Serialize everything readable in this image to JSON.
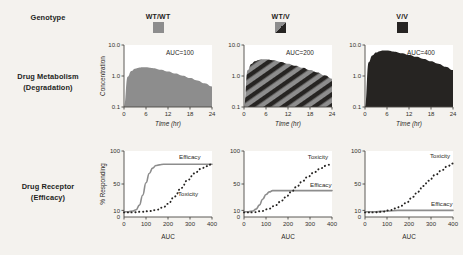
{
  "figure": {
    "background_color": "#f4f2ee",
    "row_labels": {
      "genotype": "Genotype",
      "metabolism_line1": "Drug Metabolism",
      "metabolism_line2": "(Degradation)",
      "receptor_line1": "Drug Receptor",
      "receptor_line2": "(Efficacy)"
    },
    "colors": {
      "light_gray": "#8d8d8d",
      "dark": "#262422",
      "axis": "#4a4744",
      "panel": "#ffffff"
    }
  },
  "genotypes": [
    {
      "label": "WT/WT",
      "swatch": "solid-gray-swatch-icon"
    },
    {
      "label": "WT/V",
      "swatch": "half-diagonal-swatch-icon"
    },
    {
      "label": "V/V",
      "swatch": "solid-dark-swatch-icon"
    }
  ],
  "chart_data": [
    {
      "type": "area",
      "panel": "metabolism-wt-wt",
      "genotype": "WT/WT",
      "title": "",
      "annotation": "AUC=100",
      "xlabel": "Time (hr)",
      "ylabel": "Concentration",
      "xlim": [
        0,
        24
      ],
      "ylim": [
        0.1,
        10.0
      ],
      "yscale": "log",
      "xticks": [
        0,
        6,
        12,
        18,
        24
      ],
      "xticklabels": [
        "0",
        "6",
        "12",
        "18",
        "24"
      ],
      "yticks": [
        0.1,
        1.0,
        10.0
      ],
      "yticklabels": [
        "0.1",
        "1.0",
        "10.0"
      ],
      "fill": "solid-gray",
      "x": [
        0,
        1,
        2,
        3,
        4,
        5,
        6,
        8,
        10,
        12,
        14,
        16,
        18,
        20,
        22,
        24
      ],
      "y": [
        0.1,
        0.95,
        1.45,
        1.72,
        1.85,
        1.9,
        1.9,
        1.78,
        1.6,
        1.4,
        1.2,
        1.02,
        0.86,
        0.72,
        0.58,
        0.46
      ]
    },
    {
      "type": "area",
      "panel": "metabolism-wt-v",
      "genotype": "WT/V",
      "title": "",
      "annotation": "AUC=200",
      "xlabel": "Time (hr)",
      "ylabel": "",
      "xlim": [
        0,
        24
      ],
      "ylim": [
        0.1,
        10.0
      ],
      "yscale": "log",
      "xticks": [
        0,
        6,
        12,
        18,
        24
      ],
      "xticklabels": [
        "0",
        "6",
        "12",
        "18",
        "24"
      ],
      "yticks": [
        0.1,
        1.0,
        10.0
      ],
      "yticklabels": [
        "0.1",
        "1.0",
        "10.0"
      ],
      "fill": "diagonal-stripes",
      "x": [
        0,
        1,
        2,
        3,
        4,
        5,
        6,
        8,
        10,
        12,
        14,
        16,
        18,
        20,
        22,
        24
      ],
      "y": [
        0.1,
        1.55,
        2.45,
        3.0,
        3.3,
        3.45,
        3.45,
        3.2,
        2.85,
        2.5,
        2.15,
        1.85,
        1.55,
        1.3,
        1.05,
        0.82
      ]
    },
    {
      "type": "area",
      "panel": "metabolism-v-v",
      "genotype": "V/V",
      "title": "",
      "annotation": "AUC=400",
      "xlabel": "Time (hr)",
      "ylabel": "",
      "xlim": [
        0,
        24
      ],
      "ylim": [
        0.1,
        10.0
      ],
      "yscale": "log",
      "xticks": [
        0,
        6,
        12,
        18,
        24
      ],
      "xticklabels": [
        "0",
        "6",
        "12",
        "18",
        "24"
      ],
      "yticks": [
        0.1,
        1.0,
        10.0
      ],
      "yticklabels": [
        "0.1",
        "1.0",
        "10.0"
      ],
      "fill": "solid-dark",
      "x": [
        0,
        1,
        2,
        3,
        4,
        5,
        6,
        8,
        10,
        12,
        14,
        16,
        18,
        20,
        22,
        24
      ],
      "y": [
        0.1,
        2.8,
        4.6,
        5.7,
        6.3,
        6.6,
        6.6,
        6.1,
        5.45,
        4.8,
        4.15,
        3.55,
        3.0,
        2.5,
        2.0,
        1.55
      ]
    },
    {
      "type": "line",
      "panel": "receptor-wt-wt",
      "genotype": "WT/WT",
      "title": "",
      "xlabel": "AUC",
      "ylabel": "% Responding",
      "xlim": [
        0,
        400
      ],
      "ylim": [
        0,
        100
      ],
      "xticks": [
        0,
        100,
        200,
        300,
        400
      ],
      "xticklabels": [
        "0",
        "100",
        "200",
        "300",
        "400"
      ],
      "yticks": [
        10,
        50,
        100
      ],
      "yticklabels": [
        "10",
        "50",
        "100"
      ],
      "series": [
        {
          "name": "Efficacy",
          "style": "solid-gray",
          "label_x": 250,
          "label_y": 88,
          "x": [
            0,
            20,
            40,
            55,
            70,
            85,
            100,
            115,
            130,
            145,
            160,
            180,
            200,
            250,
            300,
            350,
            400
          ],
          "y": [
            8,
            8,
            9,
            11,
            18,
            33,
            52,
            66,
            74,
            78,
            79,
            80,
            80,
            80,
            80,
            80,
            80
          ]
        },
        {
          "name": "Toxicity",
          "style": "dotted-dark",
          "label_x": 245,
          "label_y": 32,
          "x": [
            0,
            40,
            80,
            120,
            150,
            180,
            200,
            230,
            260,
            290,
            320,
            350,
            375,
            400
          ],
          "y": [
            7,
            7,
            8,
            9,
            11,
            15,
            20,
            31,
            44,
            56,
            66,
            73,
            77,
            80
          ]
        }
      ]
    },
    {
      "type": "line",
      "panel": "receptor-wt-v",
      "genotype": "WT/V",
      "title": "",
      "xlabel": "AUC",
      "ylabel": "",
      "xlim": [
        0,
        400
      ],
      "ylim": [
        0,
        100
      ],
      "xticks": [
        0,
        100,
        200,
        300,
        400
      ],
      "xticklabels": [
        "0",
        "100",
        "200",
        "300",
        "400"
      ],
      "yticks": [
        10,
        50,
        100
      ],
      "yticklabels": [
        "10",
        "50",
        "100"
      ],
      "series": [
        {
          "name": "Efficacy",
          "style": "solid-gray",
          "label_x": 300,
          "label_y": 46,
          "x": [
            0,
            20,
            40,
            55,
            70,
            85,
            100,
            115,
            130,
            145,
            160,
            180,
            200,
            250,
            300,
            350,
            400
          ],
          "y": [
            8,
            8,
            9,
            12,
            18,
            27,
            34,
            38,
            40,
            40,
            40,
            40,
            40,
            40,
            40,
            40,
            40
          ]
        },
        {
          "name": "Toxicity",
          "style": "dotted-dark",
          "label_x": 290,
          "label_y": 88,
          "x": [
            0,
            40,
            80,
            110,
            140,
            165,
            190,
            215,
            240,
            265,
            290,
            320,
            350,
            375,
            400
          ],
          "y": [
            7,
            7,
            9,
            12,
            17,
            23,
            30,
            38,
            46,
            54,
            61,
            68,
            74,
            78,
            81
          ]
        }
      ]
    },
    {
      "type": "line",
      "panel": "receptor-v-v",
      "genotype": "V/V",
      "title": "",
      "xlabel": "AUC",
      "ylabel": "",
      "xlim": [
        0,
        400
      ],
      "ylim": [
        0,
        100
      ],
      "xticks": [
        0,
        100,
        200,
        300,
        400
      ],
      "xticklabels": [
        "0",
        "100",
        "200",
        "300",
        "400"
      ],
      "yticks": [
        10,
        50,
        100
      ],
      "yticklabels": [
        "10",
        "50",
        "100"
      ],
      "series": [
        {
          "name": "Efficacy",
          "style": "solid-gray",
          "label_x": 300,
          "label_y": 17,
          "x": [
            0,
            50,
            100,
            150,
            200,
            250,
            300,
            350,
            400
          ],
          "y": [
            8,
            8,
            9,
            10,
            10,
            10,
            10,
            10,
            10
          ]
        },
        {
          "name": "Toxicity",
          "style": "dotted-dark",
          "label_x": 295,
          "label_y": 90,
          "x": [
            0,
            40,
            80,
            110,
            140,
            165,
            190,
            215,
            240,
            265,
            290,
            320,
            350,
            375,
            400
          ],
          "y": [
            7,
            7,
            8,
            10,
            13,
            17,
            22,
            30,
            38,
            47,
            55,
            64,
            71,
            77,
            81
          ]
        }
      ]
    }
  ]
}
